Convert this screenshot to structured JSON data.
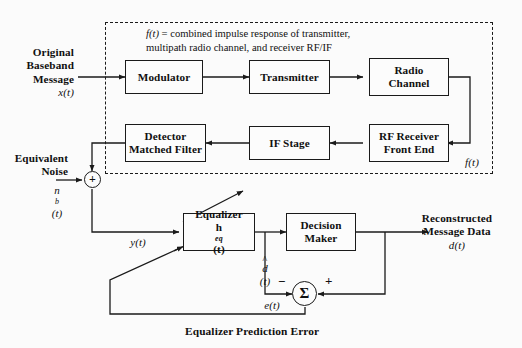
{
  "diagram": {
    "dashed_region": {
      "caption_line1_prefix": "f(t)",
      "caption_line1": " = combined impulse response of transmitter,",
      "caption_line2": "multipath radio channel, and receiver RF/IF",
      "corner_label": "f(t)"
    },
    "blocks": [
      {
        "id": "modulator",
        "line1": "Modulator",
        "line2": ""
      },
      {
        "id": "transmitter",
        "line1": "Transmitter",
        "line2": ""
      },
      {
        "id": "radio-channel",
        "line1": "Radio",
        "line2": "Channel"
      },
      {
        "id": "rf-receiver",
        "line1": "RF Receiver",
        "line2": "Front End"
      },
      {
        "id": "if-stage",
        "line1": "IF Stage",
        "line2": ""
      },
      {
        "id": "detector",
        "line1": "Detector",
        "line2": "Matched Filter"
      },
      {
        "id": "equalizer",
        "line1": "Equalizer",
        "line2": "h",
        "line2_sub": "eq",
        "line2_tail": "(t)"
      },
      {
        "id": "decision-maker",
        "line1": "Decision",
        "line2": "Maker"
      }
    ],
    "labels": {
      "input_line1": "Original",
      "input_line2": "Baseband",
      "input_line3": "Message",
      "input_signal": "x(t)",
      "noise_line1": "Equivalent",
      "noise_line2": "Noise",
      "noise_signal_base": "n",
      "noise_signal_sub": "b",
      "noise_signal_tail": "(t)",
      "equalizer_input_signal": "y(t)",
      "decision_input_signal_base": "d",
      "decision_input_signal_tail": "(t)",
      "decision_input_hat": "^",
      "output_line1": "Reconstructed",
      "output_line2": "Message Data",
      "output_signal": "d(t)",
      "error_signal": "e(t)",
      "sum_plus": "+",
      "sigma": "Σ",
      "sigma_minus_sign": "−",
      "sigma_plus_sign": "+",
      "bottom_note": "Equalizer Prediction Error"
    },
    "colors": {
      "stroke": "#1a1a1a",
      "background": "#fbfbfb",
      "block_fill": "#fcfcfc"
    }
  }
}
